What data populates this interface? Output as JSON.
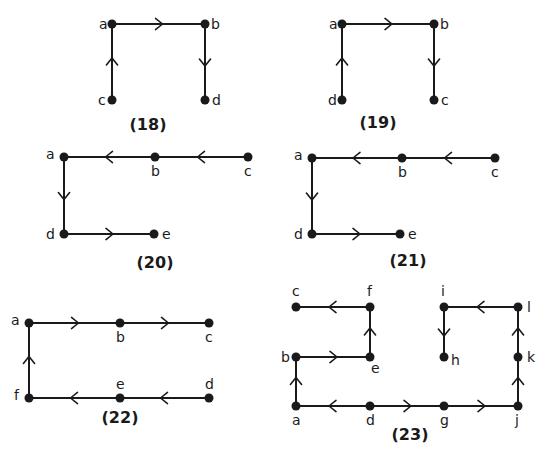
{
  "diagrams": [
    {
      "id": "18",
      "caption": "(18)",
      "caption_pos": [
        148,
        130
      ],
      "nodes": [
        {
          "name": "a",
          "x": 112,
          "y": 24,
          "lx": -13,
          "ly": 5
        },
        {
          "name": "b",
          "x": 205,
          "y": 24,
          "lx": 6,
          "ly": 5
        },
        {
          "name": "c",
          "x": 112,
          "y": 100,
          "lx": -14,
          "ly": 5
        },
        {
          "name": "d",
          "x": 205,
          "y": 100,
          "lx": 7,
          "ly": 5
        }
      ],
      "edges": [
        {
          "from": "a",
          "to": "b"
        },
        {
          "from": "b",
          "to": "d"
        },
        {
          "from": "c",
          "to": "a"
        }
      ]
    },
    {
      "id": "19",
      "caption": "(19)",
      "caption_pos": [
        378,
        128
      ],
      "nodes": [
        {
          "name": "a",
          "x": 342,
          "y": 24,
          "lx": -13,
          "ly": 5
        },
        {
          "name": "b",
          "x": 434,
          "y": 24,
          "lx": 6,
          "ly": 5
        },
        {
          "name": "d",
          "x": 342,
          "y": 100,
          "lx": -14,
          "ly": 5
        },
        {
          "name": "c",
          "x": 434,
          "y": 100,
          "lx": 7,
          "ly": 5
        }
      ],
      "edges": [
        {
          "from": "a",
          "to": "b"
        },
        {
          "from": "b",
          "to": "c"
        },
        {
          "from": "d",
          "to": "a"
        }
      ]
    },
    {
      "id": "20",
      "caption": "(20)",
      "caption_pos": [
        155,
        268
      ],
      "nodes": [
        {
          "name": "a",
          "x": 64,
          "y": 157,
          "lx": -18,
          "ly": 2
        },
        {
          "name": "b",
          "x": 155,
          "y": 157,
          "lx": -4,
          "ly": 19
        },
        {
          "name": "c",
          "x": 248,
          "y": 157,
          "lx": -4,
          "ly": 19
        },
        {
          "name": "d",
          "x": 64,
          "y": 234,
          "lx": -18,
          "ly": 5
        },
        {
          "name": "e",
          "x": 154,
          "y": 234,
          "lx": 8,
          "ly": 5
        }
      ],
      "edges": [
        {
          "from": "c",
          "to": "b"
        },
        {
          "from": "b",
          "to": "a"
        },
        {
          "from": "a",
          "to": "d"
        },
        {
          "from": "d",
          "to": "e"
        }
      ]
    },
    {
      "id": "21",
      "caption": "(21)",
      "caption_pos": [
        408,
        266
      ],
      "nodes": [
        {
          "name": "a",
          "x": 312,
          "y": 158,
          "lx": -18,
          "ly": 2
        },
        {
          "name": "b",
          "x": 402,
          "y": 158,
          "lx": -4,
          "ly": 19
        },
        {
          "name": "c",
          "x": 495,
          "y": 158,
          "lx": -4,
          "ly": 19
        },
        {
          "name": "d",
          "x": 312,
          "y": 234,
          "lx": -18,
          "ly": 5
        },
        {
          "name": "e",
          "x": 400,
          "y": 234,
          "lx": 8,
          "ly": 5
        }
      ],
      "edges": [
        {
          "from": "c",
          "to": "b"
        },
        {
          "from": "b",
          "to": "a"
        },
        {
          "from": "a",
          "to": "d"
        },
        {
          "from": "d",
          "to": "e"
        }
      ]
    },
    {
      "id": "22",
      "caption": "(22)",
      "caption_pos": [
        120,
        423
      ],
      "nodes": [
        {
          "name": "a",
          "x": 29,
          "y": 323,
          "lx": -18,
          "ly": 2
        },
        {
          "name": "b",
          "x": 120,
          "y": 323,
          "lx": -4,
          "ly": 19
        },
        {
          "name": "c",
          "x": 209,
          "y": 323,
          "lx": -4,
          "ly": 19
        },
        {
          "name": "f",
          "x": 29,
          "y": 398,
          "lx": -15,
          "ly": 2
        },
        {
          "name": "e",
          "x": 120,
          "y": 398,
          "lx": -4,
          "ly": -9
        },
        {
          "name": "d",
          "x": 209,
          "y": 398,
          "lx": -4,
          "ly": -9
        }
      ],
      "edges": [
        {
          "from": "a",
          "to": "b"
        },
        {
          "from": "b",
          "to": "c"
        },
        {
          "from": "f",
          "to": "a"
        },
        {
          "from": "d",
          "to": "e"
        },
        {
          "from": "e",
          "to": "f"
        }
      ]
    },
    {
      "id": "23",
      "caption": "(23)",
      "caption_pos": [
        410,
        440
      ],
      "nodes": [
        {
          "name": "c",
          "x": 296,
          "y": 307,
          "lx": -4,
          "ly": -11
        },
        {
          "name": "f",
          "x": 370,
          "y": 307,
          "lx": -3,
          "ly": -11
        },
        {
          "name": "i",
          "x": 444,
          "y": 307,
          "lx": -3,
          "ly": -11
        },
        {
          "name": "l",
          "x": 518,
          "y": 307,
          "lx": 9,
          "ly": 5
        },
        {
          "name": "b",
          "x": 296,
          "y": 357,
          "lx": -15,
          "ly": 5
        },
        {
          "name": "e",
          "x": 370,
          "y": 357,
          "lx": 1,
          "ly": 16
        },
        {
          "name": "h",
          "x": 444,
          "y": 357,
          "lx": 7,
          "ly": 8
        },
        {
          "name": "k",
          "x": 518,
          "y": 357,
          "lx": 9,
          "ly": 5
        },
        {
          "name": "a",
          "x": 296,
          "y": 406,
          "lx": -4,
          "ly": 19
        },
        {
          "name": "d",
          "x": 370,
          "y": 406,
          "lx": -4,
          "ly": 19
        },
        {
          "name": "g",
          "x": 444,
          "y": 406,
          "lx": -4,
          "ly": 19
        },
        {
          "name": "j",
          "x": 518,
          "y": 406,
          "lx": -3,
          "ly": 19
        }
      ],
      "edges": [
        {
          "from": "f",
          "to": "c"
        },
        {
          "from": "e",
          "to": "f"
        },
        {
          "from": "b",
          "to": "e"
        },
        {
          "from": "a",
          "to": "b"
        },
        {
          "from": "d",
          "to": "a"
        },
        {
          "from": "d",
          "to": "g"
        },
        {
          "from": "g",
          "to": "j"
        },
        {
          "from": "j",
          "to": "k"
        },
        {
          "from": "k",
          "to": "l"
        },
        {
          "from": "l",
          "to": "i"
        },
        {
          "from": "i",
          "to": "h"
        }
      ]
    }
  ]
}
